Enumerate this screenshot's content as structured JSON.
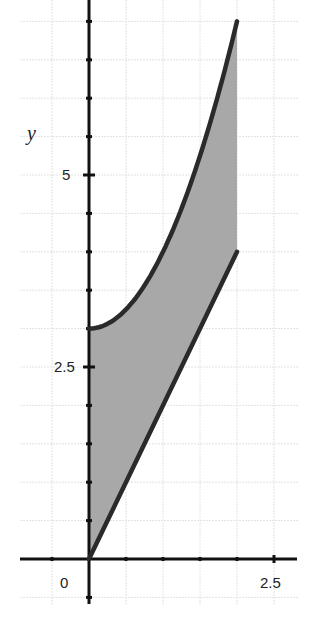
{
  "chart_data": {
    "type": "area",
    "title": "",
    "xlabel": "",
    "ylabel": "y",
    "xlim": [
      -1.0,
      2.75
    ],
    "ylim": [
      -0.6,
      7.3
    ],
    "grid": true,
    "grid_step": 0.5,
    "x_tick_labels": [
      {
        "value": 0,
        "label": "0"
      },
      {
        "value": 2.5,
        "label": "2.5"
      }
    ],
    "y_tick_labels": [
      {
        "value": 2.5,
        "label": "2.5"
      },
      {
        "value": 5,
        "label": "5"
      }
    ],
    "series": [
      {
        "name": "upper curve y = x^2 + 3",
        "x": [
          0,
          0.25,
          0.5,
          0.75,
          1.0,
          1.25,
          1.5,
          1.75,
          2.0
        ],
        "values": [
          3,
          3.0625,
          3.25,
          3.5625,
          4,
          4.5625,
          5.25,
          6.0625,
          7
        ]
      },
      {
        "name": "lower line y = 2x",
        "x": [
          0,
          2
        ],
        "values": [
          0,
          4
        ]
      }
    ],
    "shaded_region": {
      "x_from": 0,
      "x_to": 2,
      "between": [
        "upper curve y = x^2 + 3",
        "lower line y = 2x"
      ],
      "color": "#a8a8a8"
    },
    "line_color": "#2a2a2a"
  },
  "labels": {
    "y_axis": "y",
    "x_zero": "0",
    "x_two_five": "2.5",
    "y_two_five": "2.5",
    "y_five": "5"
  }
}
